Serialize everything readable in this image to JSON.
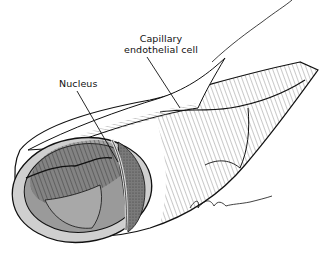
{
  "figure": {
    "labels": [
      {
        "id": "capillary-endothelial-cell",
        "lines": [
          "Capillary",
          "endothelial cell"
        ]
      },
      {
        "id": "nucleus",
        "lines": [
          "Nucleus"
        ]
      }
    ],
    "signature": "artist-signature",
    "colors": {
      "ink": "#111111",
      "vessel_wall": "#c8c8c8",
      "lumen_dark": "#6e6e6e",
      "lumen_mid": "#9a9a9a",
      "background": "#ffffff"
    }
  }
}
